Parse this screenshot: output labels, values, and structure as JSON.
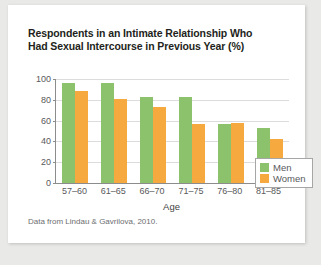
{
  "chart_data": {
    "type": "bar",
    "title": "Respondents in an Intimate Relationship Who Had Sexual Intercourse in Previous Year (%)",
    "title_lines": [
      "Respondents in an Intimate Relationship Who",
      "Had Sexual Intercourse in Previous Year (%)"
    ],
    "xlabel": "Age",
    "ylabel": "",
    "categories": [
      "57–60",
      "61–65",
      "66–70",
      "71–75",
      "76–80",
      "81–85"
    ],
    "series": [
      {
        "name": "Men",
        "color": "#8cc26b",
        "values": [
          96,
          96,
          83,
          83,
          57,
          53
        ]
      },
      {
        "name": "Women",
        "color": "#f5a93f",
        "values": [
          88,
          81,
          73,
          57,
          58,
          42
        ]
      }
    ],
    "ylim": [
      0,
      100
    ],
    "y_ticks": [
      0,
      20,
      40,
      60,
      80,
      100
    ],
    "y_tick_labels": [
      "0",
      "20",
      "40",
      "60",
      "80",
      "100"
    ],
    "grid": true,
    "legend_position": "top-right",
    "source_note": "Data from Lindau & Gavrilova, 2010."
  }
}
